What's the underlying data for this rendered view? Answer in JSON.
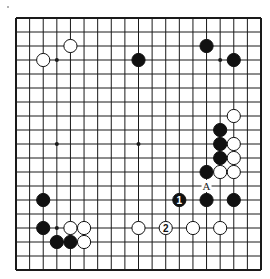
{
  "diagram": {
    "type": "go-board",
    "size": 19,
    "corner_mark": "•",
    "board": {
      "left": 16,
      "top": 18,
      "right": 261,
      "bottom": 270
    },
    "colors": {
      "line": "#1a1a1a",
      "black": "#111111",
      "white": "#ffffff",
      "background": "#ffffff"
    },
    "star_points": [
      {
        "col": 3,
        "row": 3
      },
      {
        "col": 9,
        "row": 3
      },
      {
        "col": 15,
        "row": 3
      },
      {
        "col": 3,
        "row": 9
      },
      {
        "col": 9,
        "row": 9
      },
      {
        "col": 15,
        "row": 9
      },
      {
        "col": 3,
        "row": 15
      },
      {
        "col": 9,
        "row": 15
      },
      {
        "col": 15,
        "row": 15
      }
    ],
    "stones": [
      {
        "color": "white",
        "col": 4,
        "row": 2,
        "label": ""
      },
      {
        "color": "white",
        "col": 2,
        "row": 3,
        "label": ""
      },
      {
        "color": "black",
        "col": 9,
        "row": 3,
        "label": ""
      },
      {
        "color": "black",
        "col": 14,
        "row": 2,
        "label": ""
      },
      {
        "color": "black",
        "col": 16,
        "row": 3,
        "label": ""
      },
      {
        "color": "white",
        "col": 16,
        "row": 7,
        "label": ""
      },
      {
        "color": "black",
        "col": 15,
        "row": 8,
        "label": ""
      },
      {
        "color": "black",
        "col": 15,
        "row": 9,
        "label": ""
      },
      {
        "color": "white",
        "col": 16,
        "row": 9,
        "label": ""
      },
      {
        "color": "black",
        "col": 15,
        "row": 10,
        "label": ""
      },
      {
        "color": "white",
        "col": 16,
        "row": 10,
        "label": ""
      },
      {
        "color": "black",
        "col": 14,
        "row": 11,
        "label": ""
      },
      {
        "color": "white",
        "col": 15,
        "row": 11,
        "label": ""
      },
      {
        "color": "white",
        "col": 16,
        "row": 11,
        "label": ""
      },
      {
        "color": "black",
        "col": 12,
        "row": 13,
        "label": "1"
      },
      {
        "color": "black",
        "col": 14,
        "row": 13,
        "label": ""
      },
      {
        "color": "black",
        "col": 16,
        "row": 13,
        "label": ""
      },
      {
        "color": "black",
        "col": 2,
        "row": 13,
        "label": ""
      },
      {
        "color": "black",
        "col": 2,
        "row": 15,
        "label": ""
      },
      {
        "color": "white",
        "col": 4,
        "row": 15,
        "label": ""
      },
      {
        "color": "white",
        "col": 5,
        "row": 15,
        "label": ""
      },
      {
        "color": "black",
        "col": 3,
        "row": 16,
        "label": ""
      },
      {
        "color": "black",
        "col": 4,
        "row": 16,
        "label": ""
      },
      {
        "color": "white",
        "col": 5,
        "row": 16,
        "label": ""
      },
      {
        "color": "white",
        "col": 9,
        "row": 15,
        "label": ""
      },
      {
        "color": "white",
        "col": 11,
        "row": 15,
        "label": "2"
      },
      {
        "color": "white",
        "col": 13,
        "row": 15,
        "label": ""
      },
      {
        "color": "white",
        "col": 15,
        "row": 15,
        "label": ""
      }
    ],
    "marks": [
      {
        "col": 14,
        "row": 12,
        "label": "A"
      }
    ]
  }
}
